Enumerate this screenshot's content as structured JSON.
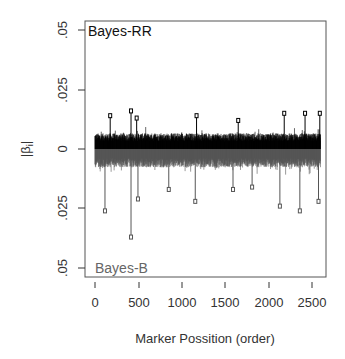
{
  "chart_data": {
    "type": "line",
    "subtype": "mirrored-needle-plot",
    "title": "",
    "xlabel": "Marker Possition (order)",
    "ylabel": "|β_i|",
    "xlim": [
      0,
      2600
    ],
    "ylim": [
      -0.05,
      0.05
    ],
    "x_ticks": [
      0,
      500,
      1000,
      1500,
      2000,
      2500
    ],
    "x_tick_labels": [
      "0",
      "500",
      "1000",
      "1500",
      "2000",
      "2500"
    ],
    "y_ticks": [
      0.05,
      0.025,
      0,
      -0.025,
      -0.05
    ],
    "y_tick_labels": [
      ".05",
      ".025",
      "0",
      ".025",
      ".05"
    ],
    "grid": false,
    "n_markers": 2600,
    "series": [
      {
        "name": "Bayes-RR",
        "direction": "up",
        "color": "#000000",
        "typical_abs_effect": 0.006,
        "peaks": [
          {
            "x": 175,
            "y": 0.014
          },
          {
            "x": 415,
            "y": 0.016
          },
          {
            "x": 480,
            "y": 0.013
          },
          {
            "x": 1170,
            "y": 0.014
          },
          {
            "x": 1650,
            "y": 0.012
          },
          {
            "x": 2180,
            "y": 0.015
          },
          {
            "x": 2420,
            "y": 0.015
          },
          {
            "x": 2590,
            "y": 0.015
          }
        ]
      },
      {
        "name": "Bayes-B",
        "direction": "down",
        "color": "#555555",
        "typical_abs_effect": 0.007,
        "peaks": [
          {
            "x": 115,
            "y": 0.026
          },
          {
            "x": 415,
            "y": 0.037
          },
          {
            "x": 495,
            "y": 0.021
          },
          {
            "x": 850,
            "y": 0.017
          },
          {
            "x": 1155,
            "y": 0.022
          },
          {
            "x": 1590,
            "y": 0.017
          },
          {
            "x": 1810,
            "y": 0.016
          },
          {
            "x": 2130,
            "y": 0.024
          },
          {
            "x": 2360,
            "y": 0.026
          },
          {
            "x": 2575,
            "y": 0.022
          }
        ]
      }
    ],
    "annotations": [
      {
        "text": "Bayes-RR",
        "position": "top-left",
        "color": "#111111"
      },
      {
        "text": "Bayes-B",
        "position": "bottom-left",
        "color": "#666666"
      }
    ]
  },
  "labels": {
    "xlabel": "Marker Possition (order)",
    "ylabel_main": "|β",
    "ylabel_sub": "i",
    "ylabel_end": "|",
    "panel_top": "Bayes-RR",
    "panel_bottom": "Bayes-B",
    "yt0": ".05",
    "yt1": ".025",
    "yt2": "0",
    "yt3": ".025",
    "yt4": ".05",
    "xt0": "0",
    "xt1": "500",
    "xt2": "1000",
    "xt3": "1500",
    "xt4": "2000",
    "xt5": "2500"
  }
}
